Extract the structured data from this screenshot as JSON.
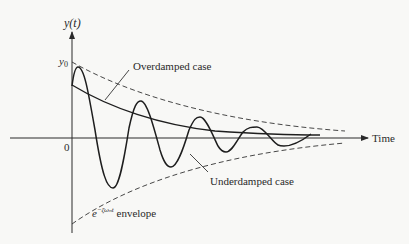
{
  "diagram": {
    "y_axis_label": "y(t)",
    "x_axis_label": "Time",
    "origin_label": "0",
    "initial_value_label": "y0",
    "labels": {
      "overdamped": "Overdamped case",
      "underdamped": "Underdamped case",
      "envelope_base": "e",
      "envelope_exponent": "−ζωₙt",
      "envelope_word": "envelope"
    },
    "curves": [
      {
        "name": "overdamped",
        "style": "solid"
      },
      {
        "name": "underdamped",
        "style": "solid",
        "oscillating": true
      },
      {
        "name": "upper-envelope",
        "style": "dashed"
      },
      {
        "name": "lower-envelope",
        "style": "dashed"
      }
    ],
    "colors": {
      "ink": "#2a2a2a",
      "background": "#f8f8f6"
    }
  }
}
